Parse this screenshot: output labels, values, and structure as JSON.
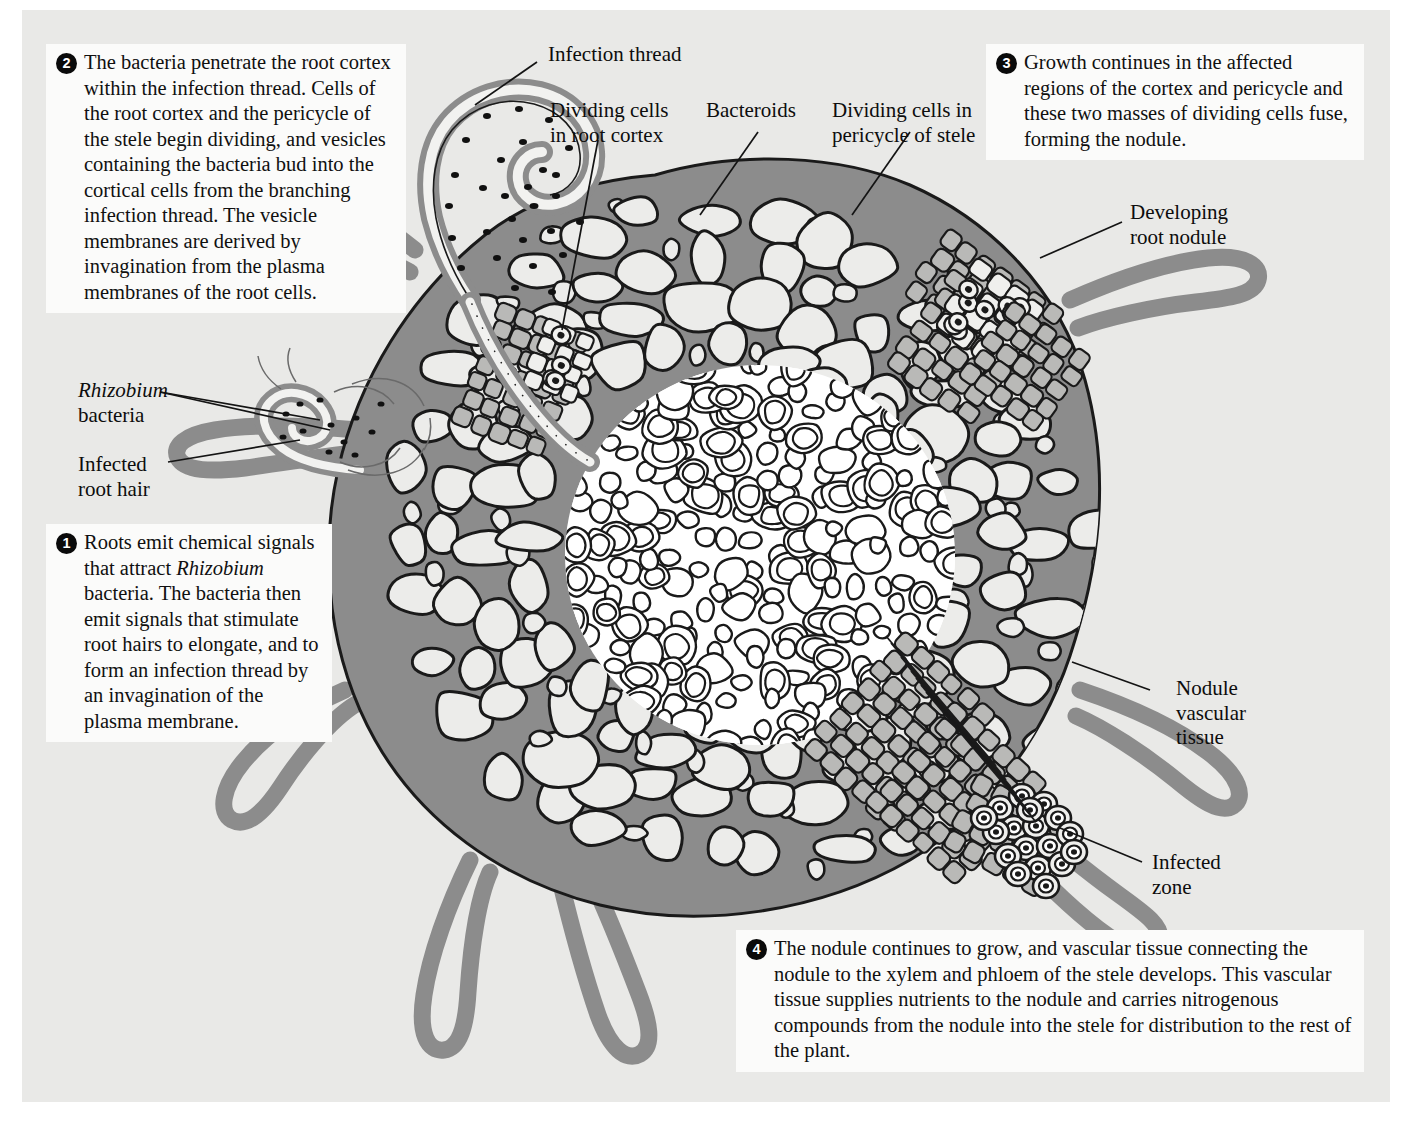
{
  "page": {
    "background_color": "#e9e9e7",
    "caption_box_color": "#fbfbfa",
    "wall_color": "#8c8c8c",
    "lumen_color": "#ececea",
    "stele_color": "#ffffff",
    "ink_color": "#1a1a1a"
  },
  "captions": [
    {
      "number": "1",
      "text": "Roots emit chemical signals that attract Rhizobium bacteria. The bacteria then emit signals that stimulate root hairs to elongate, and to form an infection thread by an invagination of the plasma membrane.",
      "italic_terms": [
        "Rhizobium"
      ]
    },
    {
      "number": "2",
      "text": "The bacteria penetrate the root cortex within the infection thread. Cells of the root cortex and the pericycle of the stele begin dividing, and vesicles containing the bacteria bud into the cortical cells from the branching infection thread. The vesicle membranes are derived by invagination from the plasma membranes of the root cells."
    },
    {
      "number": "3",
      "text": "Growth continues in the affected regions of the cortex and pericycle and these two masses of dividing cells fuse, forming the nodule."
    },
    {
      "number": "4",
      "text": "The nodule continues to grow, and vascular tissue connecting the nodule to the xylem and phloem of the stele develops. This vascular tissue supplies nutrients to the nodule and carries nitrogenous compounds from the nodule into the stele for distribution to the rest of the plant."
    }
  ],
  "labels": {
    "infection_thread": "Infection thread",
    "dividing_cells_cortex_l1": "Dividing cells",
    "dividing_cells_cortex_l2": "in root cortex",
    "bacteroids": "Bacteroids",
    "dividing_cells_pericycle_l1": "Dividing cells in",
    "dividing_cells_pericycle_l2": "pericycle of stele",
    "developing_nodule_l1": "Developing",
    "developing_nodule_l2": "root nodule",
    "rhizobium_l1": "Rhizobium",
    "rhizobium_l2": "bacteria",
    "infected_root_hair_l1": "Infected",
    "infected_root_hair_l2": "root hair",
    "nodule_vascular_l1": "Nodule",
    "nodule_vascular_l2": "vascular",
    "nodule_vascular_l3": "tissue",
    "infected_zone_l1": "Infected",
    "infected_zone_l2": "zone"
  }
}
